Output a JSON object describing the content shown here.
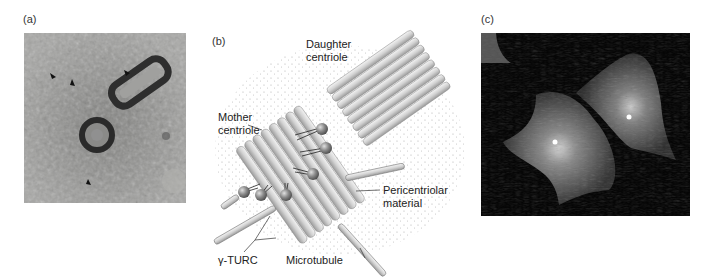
{
  "figure": {
    "panels": [
      {
        "id": "a",
        "label": "(a)",
        "type": "electron-micrograph",
        "description": "Centriole pair in cross-section and longitudinal section with arrows"
      },
      {
        "id": "b",
        "label": "(b)",
        "type": "schematic-diagram",
        "description": "Centrosome structure"
      },
      {
        "id": "c",
        "label": "(c)",
        "type": "fluorescence-micrograph",
        "description": "Microtubules radiating from centrosomes in two cells"
      }
    ],
    "diagram_labels": {
      "daughter_line1": "Daughter",
      "daughter_line2": "centriole",
      "mother_line1": "Mother",
      "mother_line2": "centriole",
      "pericentriolar_line1": "Pericentriolar",
      "pericentriolar_line2": "material",
      "gamma_turc": "γ-TURC",
      "microtubule": "Microtubule"
    },
    "colors": {
      "em_background": "#9a9a98",
      "fluorescence_background": "#050505",
      "tubule_fill": "#d8d8d8",
      "gamma_turc_ball": "#8a8a8a"
    }
  }
}
